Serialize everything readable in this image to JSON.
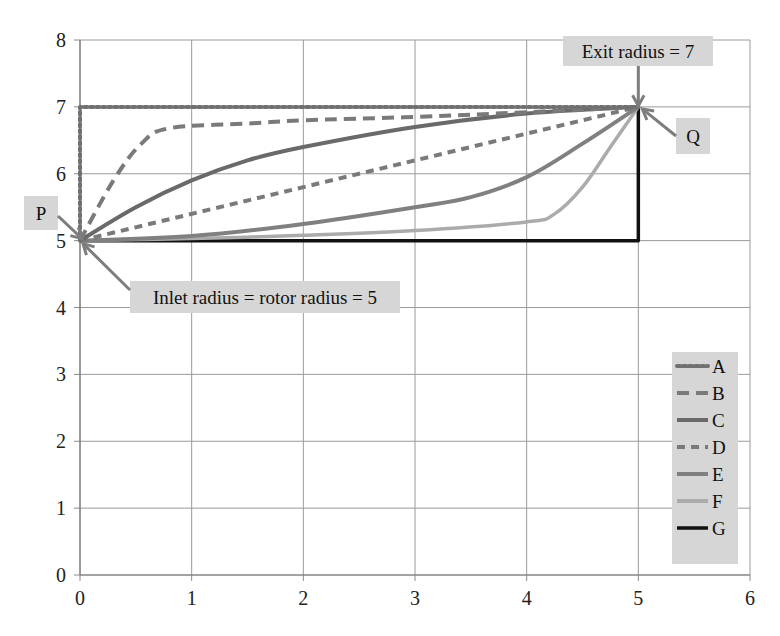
{
  "chart_data": {
    "type": "line",
    "title": "",
    "xlabel": "",
    "ylabel": "",
    "xlim": [
      0,
      6
    ],
    "ylim": [
      0,
      8
    ],
    "x_ticks": [
      "0",
      "1",
      "2",
      "3",
      "4",
      "5",
      "6"
    ],
    "y_ticks": [
      "0",
      "1",
      "2",
      "3",
      "4",
      "5",
      "6",
      "7",
      "8"
    ],
    "grid": true,
    "legend_position": "right",
    "series": [
      {
        "name": "A",
        "style": "dotted",
        "color": "#707070",
        "points": [
          [
            0,
            5
          ],
          [
            0,
            7
          ],
          [
            5,
            7
          ]
        ]
      },
      {
        "name": "B",
        "style": "dashed",
        "color": "#7a7a7a",
        "points": [
          [
            0,
            5
          ],
          [
            0.3,
            5.9
          ],
          [
            0.55,
            6.45
          ],
          [
            0.8,
            6.68
          ],
          [
            1.5,
            6.75
          ],
          [
            2,
            6.8
          ],
          [
            3,
            6.85
          ],
          [
            4,
            6.92
          ],
          [
            5,
            7
          ]
        ]
      },
      {
        "name": "C",
        "style": "solid",
        "color": "#6a6a6a",
        "points": [
          [
            0,
            5
          ],
          [
            0.5,
            5.5
          ],
          [
            1,
            5.9
          ],
          [
            1.5,
            6.2
          ],
          [
            2,
            6.4
          ],
          [
            3,
            6.7
          ],
          [
            4,
            6.9
          ],
          [
            5,
            7
          ]
        ]
      },
      {
        "name": "D",
        "style": "short-dashed",
        "color": "#7a7a7a",
        "points": [
          [
            0,
            5
          ],
          [
            5,
            7
          ]
        ]
      },
      {
        "name": "E",
        "style": "solid",
        "color": "#808080",
        "points": [
          [
            0,
            5
          ],
          [
            1,
            5.07
          ],
          [
            2,
            5.25
          ],
          [
            3,
            5.5
          ],
          [
            3.5,
            5.65
          ],
          [
            4,
            5.95
          ],
          [
            4.5,
            6.45
          ],
          [
            5,
            7
          ]
        ]
      },
      {
        "name": "F",
        "style": "solid",
        "color": "#ababab",
        "points": [
          [
            0,
            5
          ],
          [
            1,
            5.03
          ],
          [
            2,
            5.08
          ],
          [
            3,
            5.15
          ],
          [
            4,
            5.28
          ],
          [
            4.25,
            5.4
          ],
          [
            4.5,
            5.8
          ],
          [
            4.75,
            6.4
          ],
          [
            5,
            7
          ]
        ]
      },
      {
        "name": "G",
        "style": "solid",
        "color": "#111111",
        "points": [
          [
            0,
            5
          ],
          [
            5,
            5
          ],
          [
            5,
            7
          ]
        ]
      }
    ],
    "annotations": [
      {
        "id": "P",
        "text": "P",
        "points_to": [
          0,
          5
        ]
      },
      {
        "id": "Q",
        "text": "Q",
        "points_to": [
          5,
          7
        ]
      },
      {
        "id": "exit",
        "text": "Exit radius = 7",
        "points_to": [
          5,
          7
        ]
      },
      {
        "id": "inlet",
        "text": "Inlet radius = rotor radius = 5",
        "points_to": [
          0,
          5
        ]
      }
    ]
  }
}
